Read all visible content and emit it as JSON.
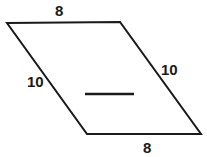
{
  "figure": {
    "kind": "parallelogram-diagram",
    "background_color": "#ffffff",
    "stroke_color": "#1a1a1a",
    "stroke_width": 2,
    "label_color": "#1a1a1a",
    "shape": {
      "name": "parallelogram",
      "vertices": [
        {
          "name": "top-left",
          "x": 7,
          "y": 23
        },
        {
          "name": "top-right",
          "x": 120,
          "y": 22
        },
        {
          "name": "bottom-right",
          "x": 201,
          "y": 134
        },
        {
          "name": "bottom-left",
          "x": 87,
          "y": 134
        }
      ],
      "points_attr": "7,23 120,22 201,134 87,134"
    },
    "interior_segment": {
      "name": "interior-horizontal-segment",
      "x1": 85,
      "y1": 94,
      "x2": 134,
      "y2": 94
    },
    "labels": {
      "top": "8",
      "left": "10",
      "right": "10",
      "bottom": "8"
    }
  }
}
